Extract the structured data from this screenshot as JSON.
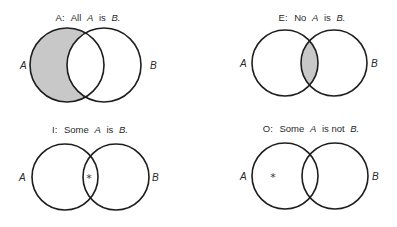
{
  "diagrams": [
    {
      "id": "A",
      "title_prefix": "A:",
      "title_text": "All",
      "subject": "A",
      "copula": "is",
      "predicate": "B.",
      "label_left": "A",
      "label_right": "B",
      "shading": "A minus B",
      "marker": ""
    },
    {
      "id": "E",
      "title_prefix": "E:",
      "title_text": "No",
      "subject": "A",
      "copula": "is",
      "predicate": "B.",
      "label_left": "A",
      "label_right": "B",
      "shading": "A intersect B",
      "marker": ""
    },
    {
      "id": "I",
      "title_prefix": "I:",
      "title_text": "Some",
      "subject": "A",
      "copula": "is",
      "predicate": "B.",
      "label_left": "A",
      "label_right": "B",
      "shading": "none",
      "marker": "*"
    },
    {
      "id": "O",
      "title_prefix": "O:",
      "title_text": "Some",
      "subject": "A",
      "copula": "is not",
      "predicate": "B.",
      "label_left": "A",
      "label_right": "B",
      "shading": "none",
      "marker": "*"
    }
  ],
  "colors": {
    "shade": "#c8c8c8",
    "stroke": "#1e1e1e"
  }
}
